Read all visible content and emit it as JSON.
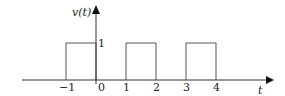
{
  "figure": {
    "y_axis_label": "v(t)",
    "x_axis_label": "t",
    "amplitude_label": "1",
    "tick_labels": [
      "−1",
      "0",
      "1",
      "2",
      "3",
      "4"
    ],
    "tick_values": [
      -1,
      0,
      1,
      2,
      3,
      4
    ],
    "pulses": [
      {
        "start": -1,
        "end": 0,
        "height": 1
      },
      {
        "start": 1,
        "end": 2,
        "height": 1
      },
      {
        "start": 3,
        "end": 4,
        "height": 1
      }
    ]
  }
}
